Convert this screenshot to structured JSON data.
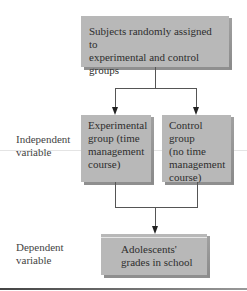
{
  "diagram": {
    "type": "flowchart",
    "nodes": {
      "assignment": {
        "lines": [
          "Subjects randomly assigned to",
          "experimental and control groups"
        ]
      },
      "experimental": {
        "lines": [
          "Experimental",
          "group (time",
          "management",
          "course)"
        ]
      },
      "control": {
        "lines": [
          "Control group",
          "(no time",
          "management",
          "course)"
        ]
      },
      "outcome": {
        "lines": [
          "Adolescents'",
          "grades in school"
        ]
      }
    },
    "row_labels": {
      "independent": [
        "Independent",
        "variable"
      ],
      "dependent": [
        "Dependent",
        "variable"
      ]
    },
    "edges": [
      {
        "from": "assignment",
        "to": "experimental"
      },
      {
        "from": "assignment",
        "to": "control"
      },
      {
        "from": "experimental",
        "to": "outcome"
      },
      {
        "from": "control",
        "to": "outcome"
      }
    ],
    "colors": {
      "box_fill": "#b8b8b8",
      "box_shadow": "#8f8f8f",
      "line": "#555555",
      "arrow": "#222222"
    }
  }
}
